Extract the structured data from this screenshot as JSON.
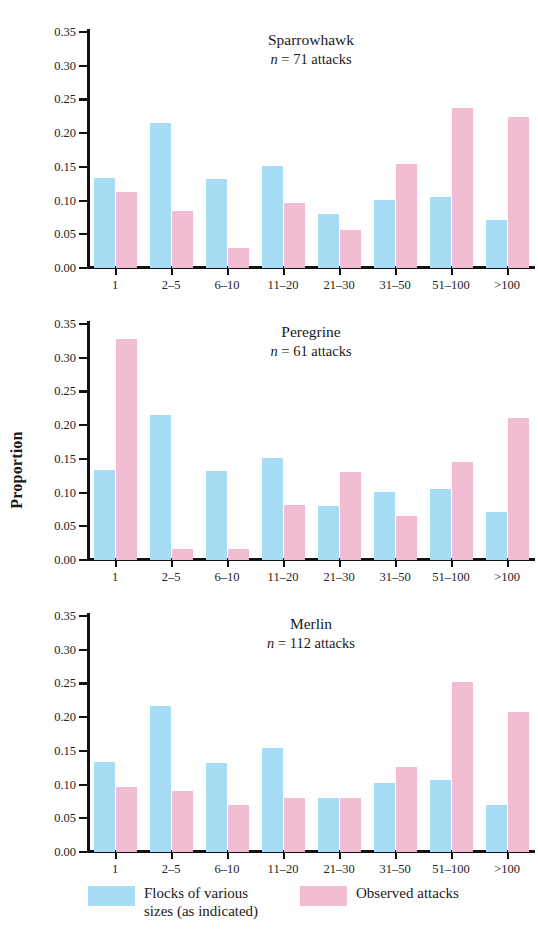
{
  "figure": {
    "ylabel": "Proportion",
    "y_ticks": [
      "0.35",
      "0.30",
      "0.25",
      "0.20",
      "0.15",
      "0.10",
      "0.05",
      "0.00"
    ],
    "categories": [
      "1",
      "2–5",
      "6–10",
      "11–20",
      "21–30",
      "31–50",
      "51–100",
      ">100"
    ]
  },
  "legend": {
    "flocks": {
      "label": "Flocks of various\nsizes (as indicated)",
      "color": "#a6dcf4"
    },
    "observed": {
      "label": "Observed attacks",
      "color": "#f2bdd3"
    }
  },
  "panels": [
    {
      "species": "Sparrowhawk",
      "n_text": "n = 71 attacks",
      "n_prefix": "n",
      "n_suffix": " = 71 attacks"
    },
    {
      "species": "Peregrine",
      "n_text": "n = 61 attacks",
      "n_prefix": "n",
      "n_suffix": " = 61 attacks"
    },
    {
      "species": "Merlin",
      "n_text": "n = 112 attacks",
      "n_prefix": "n",
      "n_suffix": " = 112 attacks"
    }
  ],
  "chart_data": [
    {
      "type": "bar",
      "title": "Sparrowhawk",
      "subtitle": "n = 71 attacks",
      "xlabel": "",
      "ylabel": "Proportion",
      "ylim": [
        0,
        0.35
      ],
      "yticks": [
        0,
        0.05,
        0.1,
        0.15,
        0.2,
        0.25,
        0.3,
        0.35
      ],
      "grid": false,
      "legend_position": "bottom",
      "categories": [
        "1",
        "2–5",
        "6–10",
        "11–20",
        "21–30",
        "31–50",
        "51–100",
        ">100"
      ],
      "series": [
        {
          "name": "Flocks of various sizes (as indicated)",
          "color": "#a6dcf4",
          "values": [
            0.134,
            0.215,
            0.132,
            0.152,
            0.08,
            0.101,
            0.106,
            0.071
          ]
        },
        {
          "name": "Observed attacks",
          "color": "#f2bdd3",
          "values": [
            0.113,
            0.085,
            0.03,
            0.097,
            0.056,
            0.154,
            0.238,
            0.224
          ]
        }
      ]
    },
    {
      "type": "bar",
      "title": "Peregrine",
      "subtitle": "n = 61 attacks",
      "xlabel": "",
      "ylabel": "Proportion",
      "ylim": [
        0,
        0.35
      ],
      "yticks": [
        0,
        0.05,
        0.1,
        0.15,
        0.2,
        0.25,
        0.3,
        0.35
      ],
      "grid": false,
      "legend_position": "bottom",
      "categories": [
        "1",
        "2–5",
        "6–10",
        "11–20",
        "21–30",
        "31–50",
        "51–100",
        ">100"
      ],
      "series": [
        {
          "name": "Flocks of various sizes (as indicated)",
          "color": "#a6dcf4",
          "values": [
            0.134,
            0.215,
            0.132,
            0.152,
            0.08,
            0.101,
            0.106,
            0.071
          ]
        },
        {
          "name": "Observed attacks",
          "color": "#f2bdd3",
          "values": [
            0.328,
            0.016,
            0.016,
            0.082,
            0.131,
            0.066,
            0.146,
            0.211
          ]
        }
      ]
    },
    {
      "type": "bar",
      "title": "Merlin",
      "subtitle": "n = 112 attacks",
      "xlabel": "",
      "ylabel": "Proportion",
      "ylim": [
        0,
        0.35
      ],
      "yticks": [
        0,
        0.05,
        0.1,
        0.15,
        0.2,
        0.25,
        0.3,
        0.35
      ],
      "grid": false,
      "legend_position": "bottom",
      "categories": [
        "1",
        "2–5",
        "6–10",
        "11–20",
        "21–30",
        "31–50",
        "51–100",
        ">100"
      ],
      "series": [
        {
          "name": "Flocks of various sizes (as indicated)",
          "color": "#a6dcf4",
          "values": [
            0.134,
            0.216,
            0.132,
            0.154,
            0.08,
            0.102,
            0.107,
            0.07
          ]
        },
        {
          "name": "Observed attacks",
          "color": "#f2bdd3",
          "values": [
            0.097,
            0.09,
            0.07,
            0.08,
            0.08,
            0.126,
            0.252,
            0.207
          ]
        }
      ]
    }
  ]
}
